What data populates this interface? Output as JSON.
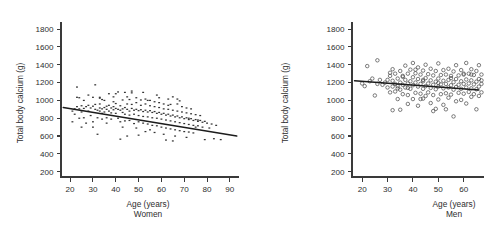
{
  "figure": {
    "panels": [
      "women",
      "men"
    ]
  },
  "chart_data": [
    {
      "type": "scatter",
      "id": "women",
      "title": "",
      "caption": "Women",
      "xlabel": "Age (years)",
      "ylabel": "Total body calcium (g)",
      "xlim": [
        16,
        94
      ],
      "ylim": [
        140,
        1880
      ],
      "xticks": [
        20,
        30,
        40,
        50,
        60,
        70,
        80,
        90
      ],
      "yticks": [
        200,
        400,
        600,
        800,
        1000,
        1200,
        1400,
        1600,
        1800
      ],
      "grid": false,
      "legend": "none",
      "marker": "filled-dot",
      "trendline": {
        "label": "regression line",
        "x": [
          17,
          93
        ],
        "y": [
          920,
          600
        ]
      },
      "points": [
        [
          21,
          760
        ],
        [
          21,
          880
        ],
        [
          22,
          905
        ],
        [
          22,
          845
        ],
        [
          23,
          1150
        ],
        [
          23,
          1035
        ],
        [
          23,
          930
        ],
        [
          24,
          1030
        ],
        [
          24,
          905
        ],
        [
          24,
          800
        ],
        [
          25,
          940
        ],
        [
          25,
          870
        ],
        [
          26,
          910
        ],
        [
          26,
          1000
        ],
        [
          26,
          805
        ],
        [
          27,
          930
        ],
        [
          27,
          745
        ],
        [
          28,
          945
        ],
        [
          28,
          880
        ],
        [
          28,
          1060
        ],
        [
          29,
          915
        ],
        [
          29,
          830
        ],
        [
          30,
          935
        ],
        [
          30,
          1035
        ],
        [
          30,
          760
        ],
        [
          31,
          900
        ],
        [
          31,
          955
        ],
        [
          31,
          1175
        ],
        [
          32,
          890
        ],
        [
          32,
          805
        ],
        [
          32,
          620
        ],
        [
          33,
          915
        ],
        [
          33,
          960
        ],
        [
          33,
          1035
        ],
        [
          33,
          880
        ],
        [
          34,
          905
        ],
        [
          34,
          855
        ],
        [
          34,
          790
        ],
        [
          35,
          920
        ],
        [
          35,
          870
        ],
        [
          35,
          1000
        ],
        [
          36,
          935
        ],
        [
          36,
          900
        ],
        [
          36,
          805
        ],
        [
          37,
          880
        ],
        [
          37,
          1075
        ],
        [
          37,
          945
        ],
        [
          38,
          915
        ],
        [
          38,
          860
        ],
        [
          38,
          790
        ],
        [
          39,
          930
        ],
        [
          39,
          895
        ],
        [
          39,
          1040
        ],
        [
          40,
          910
        ],
        [
          40,
          855
        ],
        [
          40,
          965
        ],
        [
          41,
          900
        ],
        [
          41,
          800
        ],
        [
          41,
          1095
        ],
        [
          42,
          890
        ],
        [
          42,
          940
        ],
        [
          42,
          760
        ],
        [
          42,
          565
        ],
        [
          43,
          905
        ],
        [
          43,
          865
        ],
        [
          43,
          1005
        ],
        [
          44,
          920
        ],
        [
          44,
          845
        ],
        [
          44,
          770
        ],
        [
          45,
          900
        ],
        [
          45,
          960
        ],
        [
          45,
          1040
        ],
        [
          46,
          880
        ],
        [
          46,
          835
        ],
        [
          46,
          775
        ],
        [
          47,
          910
        ],
        [
          47,
          955
        ],
        [
          47,
          1085
        ],
        [
          48,
          890
        ],
        [
          48,
          845
        ],
        [
          48,
          740
        ],
        [
          49,
          900
        ],
        [
          49,
          975
        ],
        [
          49,
          1030
        ],
        [
          50,
          885
        ],
        [
          50,
          830
        ],
        [
          50,
          760
        ],
        [
          51,
          895
        ],
        [
          51,
          945
        ],
        [
          51,
          1005
        ],
        [
          52,
          875
        ],
        [
          52,
          820
        ],
        [
          52,
          745
        ],
        [
          53,
          890
        ],
        [
          53,
          960
        ],
        [
          53,
          1015
        ],
        [
          54,
          870
        ],
        [
          54,
          815
        ],
        [
          54,
          735
        ],
        [
          55,
          885
        ],
        [
          55,
          940
        ],
        [
          55,
          1000
        ],
        [
          56,
          865
        ],
        [
          56,
          805
        ],
        [
          56,
          720
        ],
        [
          57,
          875
        ],
        [
          57,
          930
        ],
        [
          57,
          985
        ],
        [
          58,
          855
        ],
        [
          58,
          800
        ],
        [
          58,
          715
        ],
        [
          59,
          865
        ],
        [
          59,
          920
        ],
        [
          59,
          975
        ],
        [
          60,
          845
        ],
        [
          60,
          790
        ],
        [
          60,
          700
        ],
        [
          61,
          855
        ],
        [
          61,
          905
        ],
        [
          61,
          960
        ],
        [
          62,
          835
        ],
        [
          62,
          780
        ],
        [
          62,
          690
        ],
        [
          63,
          845
        ],
        [
          63,
          900
        ],
        [
          63,
          945
        ],
        [
          64,
          825
        ],
        [
          64,
          770
        ],
        [
          64,
          680
        ],
        [
          65,
          835
        ],
        [
          65,
          890
        ],
        [
          65,
          1040
        ],
        [
          66,
          815
        ],
        [
          66,
          760
        ],
        [
          66,
          670
        ],
        [
          67,
          825
        ],
        [
          67,
          880
        ],
        [
          67,
          960
        ],
        [
          68,
          805
        ],
        [
          68,
          750
        ],
        [
          68,
          660
        ],
        [
          69,
          815
        ],
        [
          69,
          870
        ],
        [
          69,
          930
        ],
        [
          70,
          795
        ],
        [
          70,
          740
        ],
        [
          70,
          650
        ],
        [
          71,
          805
        ],
        [
          71,
          860
        ],
        [
          71,
          915
        ],
        [
          72,
          785
        ],
        [
          72,
          730
        ],
        [
          72,
          645
        ],
        [
          73,
          795
        ],
        [
          73,
          850
        ],
        [
          73,
          905
        ],
        [
          74,
          775
        ],
        [
          74,
          720
        ],
        [
          74,
          635
        ],
        [
          75,
          785
        ],
        [
          75,
          840
        ],
        [
          75,
          700
        ],
        [
          76,
          765
        ],
        [
          76,
          715
        ],
        [
          77,
          775
        ],
        [
          77,
          830
        ],
        [
          78,
          755
        ],
        [
          78,
          700
        ],
        [
          79,
          765
        ],
        [
          79,
          560
        ],
        [
          80,
          745
        ],
        [
          81,
          690
        ],
        [
          82,
          735
        ],
        [
          83,
          570
        ],
        [
          84,
          720
        ],
        [
          86,
          560
        ],
        [
          33,
          1025
        ],
        [
          47,
          1105
        ],
        [
          52,
          1090
        ],
        [
          58,
          1060
        ],
        [
          63,
          1015
        ],
        [
          68,
          995
        ],
        [
          44,
          1090
        ],
        [
          39,
          985
        ],
        [
          55,
          670
        ],
        [
          61,
          620
        ],
        [
          66,
          600
        ],
        [
          71,
          585
        ],
        [
          49,
          690
        ],
        [
          53,
          650
        ],
        [
          57,
          640
        ],
        [
          43,
          700
        ],
        [
          36,
          745
        ],
        [
          30,
          700
        ],
        [
          25,
          700
        ],
        [
          67,
          1015
        ],
        [
          72,
          800
        ],
        [
          76,
          780
        ],
        [
          45,
          600
        ],
        [
          50,
          610
        ],
        [
          62,
          555
        ],
        [
          65,
          545
        ],
        [
          34,
          1010
        ],
        [
          40,
          1075
        ],
        [
          46,
          1010
        ],
        [
          54,
          1000
        ],
        [
          59,
          1030
        ],
        [
          64,
          955
        ]
      ]
    },
    {
      "type": "scatter",
      "id": "men",
      "title": "",
      "caption": "Men",
      "xlabel": "Age (years)",
      "ylabel": "Total body calcium (g)",
      "xlim": [
        16,
        68
      ],
      "ylim": [
        140,
        1880
      ],
      "xticks": [
        20,
        30,
        40,
        50,
        60
      ],
      "yticks": [
        200,
        400,
        600,
        800,
        1000,
        1200,
        1400,
        1600,
        1800
      ],
      "grid": false,
      "legend": "none",
      "marker": "open-circle",
      "trendline": {
        "label": "regression line",
        "x": [
          17,
          66
        ],
        "y": [
          1220,
          1118
        ]
      },
      "points": [
        [
          20,
          1190
        ],
        [
          21,
          1160
        ],
        [
          22,
          1385
        ],
        [
          23,
          1215
        ],
        [
          24,
          1245
        ],
        [
          25,
          1055
        ],
        [
          26,
          1450
        ],
        [
          26,
          1185
        ],
        [
          27,
          1230
        ],
        [
          28,
          1175
        ],
        [
          29,
          1200
        ],
        [
          30,
          1230
        ],
        [
          30,
          1145
        ],
        [
          31,
          1310
        ],
        [
          31,
          1275
        ],
        [
          31,
          1090
        ],
        [
          32,
          1350
        ],
        [
          32,
          1220
        ],
        [
          32,
          1155
        ],
        [
          32,
          890
        ],
        [
          33,
          1300
        ],
        [
          33,
          1185
        ],
        [
          33,
          1100
        ],
        [
          34,
          1245
        ],
        [
          34,
          1160
        ],
        [
          34,
          1015
        ],
        [
          35,
          1330
        ],
        [
          35,
          1200
        ],
        [
          35,
          1120
        ],
        [
          35,
          895
        ],
        [
          36,
          1265
        ],
        [
          36,
          1175
        ],
        [
          36,
          1070
        ],
        [
          37,
          1390
        ],
        [
          37,
          1230
        ],
        [
          37,
          1145
        ],
        [
          38,
          1300
        ],
        [
          38,
          1190
        ],
        [
          38,
          1060
        ],
        [
          38,
          960
        ],
        [
          39,
          1345
        ],
        [
          39,
          1215
        ],
        [
          39,
          1130
        ],
        [
          40,
          1420
        ],
        [
          40,
          1260
        ],
        [
          40,
          1170
        ],
        [
          40,
          1015
        ],
        [
          41,
          1305
        ],
        [
          41,
          1200
        ],
        [
          41,
          1085
        ],
        [
          42,
          1370
        ],
        [
          42,
          1240
        ],
        [
          42,
          1155
        ],
        [
          42,
          940
        ],
        [
          43,
          1290
        ],
        [
          43,
          1185
        ],
        [
          43,
          1075
        ],
        [
          44,
          1335
        ],
        [
          44,
          1215
        ],
        [
          44,
          1130
        ],
        [
          44,
          1020
        ],
        [
          45,
          1400
        ],
        [
          45,
          1250
        ],
        [
          45,
          1160
        ],
        [
          45,
          1050
        ],
        [
          46,
          1295
        ],
        [
          46,
          1190
        ],
        [
          46,
          1090
        ],
        [
          47,
          1355
        ],
        [
          47,
          1225
        ],
        [
          47,
          1140
        ],
        [
          47,
          970
        ],
        [
          48,
          1280
        ],
        [
          48,
          1175
        ],
        [
          48,
          1060
        ],
        [
          48,
          880
        ],
        [
          49,
          1330
        ],
        [
          49,
          1210
        ],
        [
          49,
          1125
        ],
        [
          50,
          1415
        ],
        [
          50,
          1245
        ],
        [
          50,
          1155
        ],
        [
          50,
          1010
        ],
        [
          51,
          1285
        ],
        [
          51,
          1180
        ],
        [
          51,
          1070
        ],
        [
          52,
          1340
        ],
        [
          52,
          1220
        ],
        [
          52,
          1135
        ],
        [
          52,
          950
        ],
        [
          53,
          1290
        ],
        [
          53,
          1185
        ],
        [
          53,
          1080
        ],
        [
          54,
          1355
        ],
        [
          54,
          1230
        ],
        [
          54,
          1145
        ],
        [
          54,
          1030
        ],
        [
          55,
          1275
        ],
        [
          55,
          1170
        ],
        [
          55,
          1065
        ],
        [
          56,
          1325
        ],
        [
          56,
          1205
        ],
        [
          56,
          1120
        ],
        [
          56,
          820
        ],
        [
          57,
          1395
        ],
        [
          57,
          1240
        ],
        [
          57,
          1150
        ],
        [
          57,
          990
        ],
        [
          58,
          1280
        ],
        [
          58,
          1175
        ],
        [
          58,
          1085
        ],
        [
          59,
          1340
        ],
        [
          59,
          1215
        ],
        [
          59,
          1130
        ],
        [
          59,
          1005
        ],
        [
          60,
          1290
        ],
        [
          60,
          1185
        ],
        [
          60,
          1075
        ],
        [
          61,
          1420
        ],
        [
          61,
          1235
        ],
        [
          61,
          1145
        ],
        [
          61,
          965
        ],
        [
          62,
          1300
        ],
        [
          62,
          1190
        ],
        [
          62,
          1095
        ],
        [
          63,
          1350
        ],
        [
          63,
          1225
        ],
        [
          63,
          1135
        ],
        [
          63,
          1040
        ],
        [
          64,
          1285
        ],
        [
          64,
          1180
        ],
        [
          64,
          1070
        ],
        [
          65,
          1330
        ],
        [
          65,
          1210
        ],
        [
          65,
          1125
        ],
        [
          65,
          900
        ],
        [
          66,
          1395
        ],
        [
          66,
          1240
        ],
        [
          66,
          1155
        ],
        [
          66,
          1050
        ],
        [
          67,
          1290
        ],
        [
          67,
          1185
        ],
        [
          67,
          1090
        ],
        [
          67,
          1225
        ],
        [
          44,
          1230
        ],
        [
          50,
          1195
        ],
        [
          38,
          1140
        ],
        [
          34,
          1135
        ],
        [
          43,
          1015
        ],
        [
          53,
          900
        ],
        [
          49,
          905
        ],
        [
          36,
          1275
        ],
        [
          41,
          1345
        ],
        [
          55,
          1250
        ],
        [
          60,
          1300
        ],
        [
          63,
          1290
        ]
      ]
    }
  ]
}
